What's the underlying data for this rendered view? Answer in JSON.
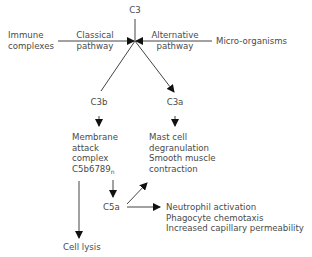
{
  "diagram": {
    "top_node": "C3",
    "left_input": {
      "line1": "Immune",
      "line2": "complexes"
    },
    "right_input": "Micro-organisms",
    "classical": {
      "line1": "Classical",
      "line2": "pathway"
    },
    "alternative": {
      "line1": "Alternative",
      "line2": "pathway"
    },
    "c3b": "C3b",
    "c3a": "C3a",
    "mac": {
      "line1": "Membrane",
      "line2": "attack",
      "line3": "complex",
      "line4": "C5b6789",
      "subscript": "n"
    },
    "c3a_effects": {
      "line1": "Mast cell",
      "line2": "degranulation",
      "line3": "Smooth muscle",
      "line4": "contraction"
    },
    "c5a": "C5a",
    "c5a_effects": {
      "line1": "Neutrophil activation",
      "line2": "Phagocyte chemotaxis",
      "line3": "Increased capillary permeability"
    },
    "cell_lysis": "Cell lysis",
    "colors": {
      "text": "#4a4a4a",
      "line": "#333333",
      "arrow": "#111111"
    }
  }
}
